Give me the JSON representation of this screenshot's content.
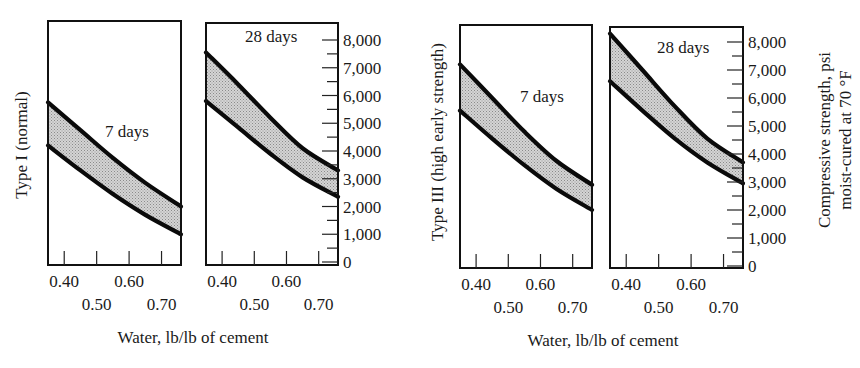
{
  "chart_data": [
    {
      "type": "area",
      "group": "Type I (normal)",
      "title": "7 days",
      "xlabel": "Water, lb/lb of cement",
      "ylabel": "Compressive strength, psi moist-cured at 70 °F",
      "xlim": [
        0.35,
        0.76
      ],
      "ylim": [
        0,
        8000
      ],
      "x_ticks": [
        0.4,
        0.5,
        0.6,
        0.7
      ],
      "y_ticks": [
        0,
        1000,
        2000,
        3000,
        4000,
        5000,
        6000,
        7000,
        8000
      ],
      "x": [
        0.35,
        0.45,
        0.55,
        0.65,
        0.76
      ],
      "series": [
        {
          "name": "upper bound",
          "values": [
            5750,
            4750,
            3750,
            2850,
            2000
          ]
        },
        {
          "name": "lower bound",
          "values": [
            4200,
            3300,
            2450,
            1700,
            1000
          ]
        }
      ]
    },
    {
      "type": "area",
      "group": "Type I (normal)",
      "title": "28 days",
      "xlabel": "Water, lb/lb of cement",
      "ylabel": "Compressive strength, psi moist-cured at 70 °F",
      "xlim": [
        0.35,
        0.76
      ],
      "ylim": [
        0,
        8000
      ],
      "x_ticks": [
        0.4,
        0.5,
        0.6,
        0.7
      ],
      "y_ticks": [
        0,
        1000,
        2000,
        3000,
        4000,
        5000,
        6000,
        7000,
        8000
      ],
      "x": [
        0.35,
        0.45,
        0.55,
        0.65,
        0.76
      ],
      "series": [
        {
          "name": "upper bound",
          "values": [
            7550,
            6400,
            5200,
            4100,
            3300
          ]
        },
        {
          "name": "lower bound",
          "values": [
            5800,
            4850,
            3900,
            3050,
            2350
          ]
        }
      ]
    },
    {
      "type": "area",
      "group": "Type III (high early strength)",
      "title": "7 days",
      "xlabel": "Water, lb/lb of cement",
      "ylabel": "Compressive strength, psi moist-cured at 70 °F",
      "xlim": [
        0.35,
        0.76
      ],
      "ylim": [
        0,
        8000
      ],
      "x_ticks": [
        0.4,
        0.5,
        0.6,
        0.7
      ],
      "y_ticks": [
        0,
        1000,
        2000,
        3000,
        4000,
        5000,
        6000,
        7000,
        8000
      ],
      "x": [
        0.35,
        0.45,
        0.55,
        0.65,
        0.76
      ],
      "series": [
        {
          "name": "upper bound",
          "values": [
            7200,
            6000,
            4800,
            3750,
            2900
          ]
        },
        {
          "name": "lower bound",
          "values": [
            5550,
            4550,
            3600,
            2750,
            2000
          ]
        }
      ]
    },
    {
      "type": "area",
      "group": "Type III (high early strength)",
      "title": "28 days",
      "xlabel": "Water, lb/lb of cement",
      "ylabel": "Compressive strength, psi moist-cured at 70 °F",
      "xlim": [
        0.35,
        0.76
      ],
      "ylim": [
        0,
        8000
      ],
      "x_ticks": [
        0.4,
        0.5,
        0.6,
        0.7
      ],
      "y_ticks": [
        0,
        1000,
        2000,
        3000,
        4000,
        5000,
        6000,
        7000,
        8000
      ],
      "x": [
        0.35,
        0.45,
        0.55,
        0.65,
        0.76
      ],
      "series": [
        {
          "name": "upper bound",
          "values": [
            8300,
            7000,
            5700,
            4550,
            3700
          ]
        },
        {
          "name": "lower bound",
          "values": [
            6600,
            5550,
            4550,
            3700,
            2950
          ]
        }
      ]
    }
  ],
  "labels": {
    "group_left": "Type I (normal)",
    "group_right": "Type III (high early strength)",
    "xlabel": "Water, lb/lb of cement",
    "ylabel_line1": "Compressive strength, psi",
    "ylabel_line2": "moist-cured at 70 °F",
    "panels": [
      "7 days",
      "28 days",
      "7 days",
      "28 days"
    ],
    "x_tick_labels": [
      "0.40",
      "0.50",
      "0.60",
      "0.70"
    ],
    "y_tick_labels": [
      "0",
      "1,000",
      "2,000",
      "3,000",
      "4,000",
      "5,000",
      "6,000",
      "7,000",
      "8,000"
    ]
  },
  "colors": {
    "line": "#0a0a0a",
    "band_fill": "#c8c8c8",
    "frame": "#111111",
    "background": "#ffffff"
  }
}
